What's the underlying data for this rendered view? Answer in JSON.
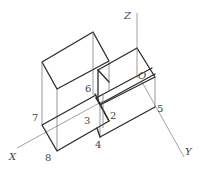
{
  "diagram": {
    "type": "isometric-3d-solid",
    "axes": {
      "z": "Z",
      "x": "X",
      "y": "Y",
      "origin": "O"
    },
    "point_labels": [
      "2",
      "3",
      "4",
      "5",
      "6",
      "7",
      "8"
    ],
    "colors": {
      "edge": "#2b2b2b",
      "thin": "#6a6a6a",
      "label": "#444444",
      "background": "#ffffff"
    }
  }
}
